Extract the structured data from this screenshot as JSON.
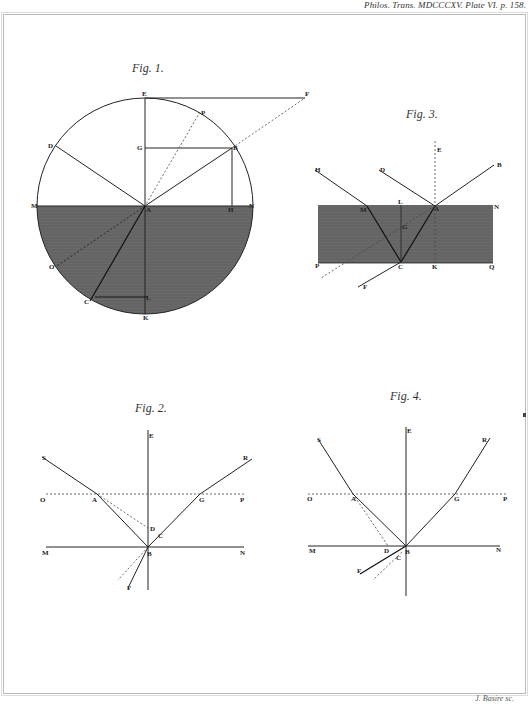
{
  "header": {
    "citation": "Philos. Trans. MDCCCXV. Plate VI. p. 158."
  },
  "footer": {
    "engraver": "J. Basire sc."
  },
  "figures": {
    "fig1": {
      "title": "Fig. 1.",
      "labels": {
        "E": "E",
        "F": "F",
        "P": "P",
        "D": "D",
        "G": "G",
        "B": "B",
        "M": "M",
        "A": "A",
        "H": "H",
        "N": "N",
        "O": "O",
        "C": "C",
        "L": "L",
        "K": "K"
      }
    },
    "fig2": {
      "title": "Fig. 2.",
      "labels": {
        "E": "E",
        "S": "S",
        "R": "R",
        "O": "O",
        "A": "A",
        "G": "G",
        "P": "P",
        "D": "D",
        "C": "C",
        "M": "M",
        "B": "B",
        "N": "N",
        "F": "F"
      }
    },
    "fig3": {
      "title": "Fig. 3.",
      "labels": {
        "E": "E",
        "H": "H",
        "D": "D",
        "B": "B",
        "M": "M",
        "L": "L",
        "A": "A",
        "N": "N",
        "G": "G",
        "P": "P",
        "C": "C",
        "K": "K",
        "Q": "Q",
        "F": "F"
      }
    },
    "fig4": {
      "title": "Fig. 4.",
      "labels": {
        "E": "E",
        "S": "S",
        "R": "R",
        "O": "O",
        "A": "A",
        "G": "G",
        "P": "P",
        "M": "M",
        "D": "D",
        "B": "B",
        "N": "N",
        "C": "C",
        "F": "F"
      }
    }
  },
  "colors": {
    "ink": "#222222",
    "medium": "#6e6e6e",
    "paper": "#ffffff"
  }
}
